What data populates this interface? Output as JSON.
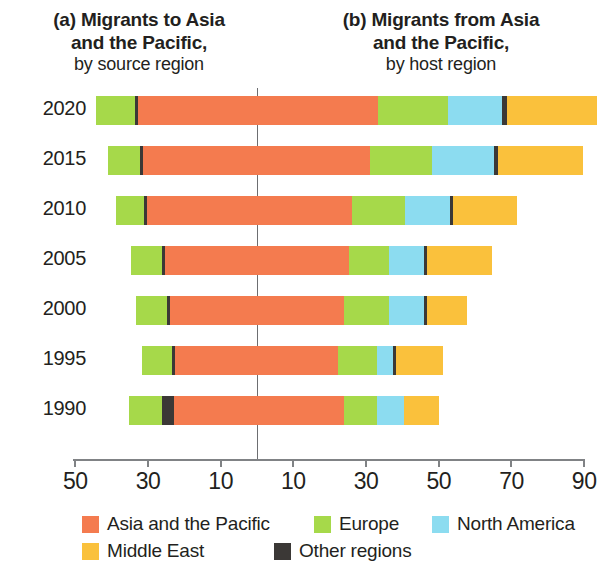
{
  "titles": {
    "panel_a": {
      "line1": "(a) Migrants to Asia",
      "line2": "and the Pacific,",
      "line3": "by source region"
    },
    "panel_b": {
      "line1": "(b) Migrants  from Asia",
      "line2": "and the Pacific,",
      "line3": "by host region"
    }
  },
  "colors": {
    "asia_pacific": "#F47B4F",
    "europe": "#A6D94A",
    "north_america": "#8CDCF0",
    "middle_east": "#FAC13C",
    "other": "#3B3836",
    "axis": "#808285",
    "zero_line": "#6D6E71",
    "text": "#231F20"
  },
  "legend": {
    "items": [
      {
        "label": "Asia and the Pacific",
        "color_key": "asia_pacific"
      },
      {
        "label": "Europe",
        "color_key": "europe"
      },
      {
        "label": "North America",
        "color_key": "north_america"
      },
      {
        "label": "Middle East",
        "color_key": "middle_east"
      },
      {
        "label": "Other regions",
        "color_key": "other"
      }
    ]
  },
  "chart_data": {
    "type": "bar",
    "subtype": "diverging-stacked-horizontal",
    "xlabel": "",
    "ylabel": "",
    "grid": false,
    "legend_position": "bottom",
    "axis": {
      "tick_values": [
        -50,
        -30,
        -10,
        10,
        30,
        50,
        70,
        90
      ],
      "tick_labels": [
        "50",
        "30",
        "10",
        "10",
        "30",
        "50",
        "70",
        "90"
      ],
      "xlim": [
        -55,
        91
      ],
      "zero_at": 0,
      "units": "millions"
    },
    "categories": [
      "2020",
      "2015",
      "2010",
      "2005",
      "2000",
      "1995",
      "1990"
    ],
    "series": [
      {
        "name": "Asia and the Pacific",
        "color_key": "asia_pacific"
      },
      {
        "name": "Europe",
        "color_key": "europe"
      },
      {
        "name": "North America",
        "color_key": "north_america"
      },
      {
        "name": "Middle East",
        "color_key": "middle_east"
      },
      {
        "name": "Other regions",
        "color_key": "other"
      }
    ],
    "rows": [
      {
        "year": "2020",
        "left": [
          {
            "series": "Europe",
            "color_key": "europe",
            "value": 10.7
          },
          {
            "series": "Other regions",
            "color_key": "other",
            "value": 0.8
          },
          {
            "series": "Asia and the Pacific",
            "color_key": "asia_pacific",
            "value": 32.8
          }
        ],
        "right": [
          {
            "series": "Asia and the Pacific",
            "color_key": "asia_pacific",
            "value": 33.2
          },
          {
            "series": "Europe",
            "color_key": "europe",
            "value": 19.3
          },
          {
            "series": "North America",
            "color_key": "north_america",
            "value": 14.9
          },
          {
            "series": "Other regions",
            "color_key": "other",
            "value": 1.4
          },
          {
            "series": "Middle East",
            "color_key": "middle_east",
            "value": 24.8
          }
        ],
        "left_total": 44.3,
        "right_total": 93.6
      },
      {
        "year": "2015",
        "left": [
          {
            "series": "Europe",
            "color_key": "europe",
            "value": 8.8
          },
          {
            "series": "Other regions",
            "color_key": "other",
            "value": 0.8
          },
          {
            "series": "Asia and the Pacific",
            "color_key": "asia_pacific",
            "value": 31.4
          }
        ],
        "right": [
          {
            "series": "Asia and the Pacific",
            "color_key": "asia_pacific",
            "value": 31.1
          },
          {
            "series": "Europe",
            "color_key": "europe",
            "value": 17.1
          },
          {
            "series": "North America",
            "color_key": "north_america",
            "value": 17.1
          },
          {
            "series": "Other regions",
            "color_key": "other",
            "value": 1.1
          },
          {
            "series": "Middle East",
            "color_key": "middle_east",
            "value": 23.4
          }
        ],
        "left_total": 41.0,
        "right_total": 89.8
      },
      {
        "year": "2010",
        "left": [
          {
            "series": "Europe",
            "color_key": "europe",
            "value": 7.7
          },
          {
            "series": "Other regions",
            "color_key": "other",
            "value": 0.8
          },
          {
            "series": "Asia and the Pacific",
            "color_key": "asia_pacific",
            "value": 30.2
          }
        ],
        "right": [
          {
            "series": "Asia and the Pacific",
            "color_key": "asia_pacific",
            "value": 26.2
          },
          {
            "series": "Europe",
            "color_key": "europe",
            "value": 14.6
          },
          {
            "series": "North America",
            "color_key": "north_america",
            "value": 12.4
          },
          {
            "series": "Other regions",
            "color_key": "other",
            "value": 0.8
          },
          {
            "series": "Middle East",
            "color_key": "middle_east",
            "value": 17.6
          }
        ],
        "left_total": 38.8,
        "right_total": 71.6
      },
      {
        "year": "2005",
        "left": [
          {
            "series": "Europe",
            "color_key": "europe",
            "value": 8.5
          },
          {
            "series": "Other regions",
            "color_key": "other",
            "value": 0.8
          },
          {
            "series": "Asia and the Pacific",
            "color_key": "asia_pacific",
            "value": 25.4
          }
        ],
        "right": [
          {
            "series": "Asia and the Pacific",
            "color_key": "asia_pacific",
            "value": 25.3
          },
          {
            "series": "Europe",
            "color_key": "europe",
            "value": 11.0
          },
          {
            "series": "North America",
            "color_key": "north_america",
            "value": 9.6
          },
          {
            "series": "Other regions",
            "color_key": "other",
            "value": 0.8
          },
          {
            "series": "Middle East",
            "color_key": "middle_east",
            "value": 17.9
          }
        ],
        "left_total": 34.7,
        "right_total": 64.6
      },
      {
        "year": "2000",
        "left": [
          {
            "series": "Europe",
            "color_key": "europe",
            "value": 8.5
          },
          {
            "series": "Other regions",
            "color_key": "other",
            "value": 0.8
          },
          {
            "series": "Asia and the Pacific",
            "color_key": "asia_pacific",
            "value": 24.5
          }
        ],
        "right": [
          {
            "series": "Asia and the Pacific",
            "color_key": "asia_pacific",
            "value": 24.0
          },
          {
            "series": "Europe",
            "color_key": "europe",
            "value": 12.4
          },
          {
            "series": "North America",
            "color_key": "north_america",
            "value": 9.6
          },
          {
            "series": "Other regions",
            "color_key": "other",
            "value": 0.8
          },
          {
            "series": "Middle East",
            "color_key": "middle_east",
            "value": 11.0
          }
        ],
        "left_total": 33.3,
        "right_total": 57.0
      },
      {
        "year": "1995",
        "left": [
          {
            "series": "Europe",
            "color_key": "europe",
            "value": 8.3
          },
          {
            "series": "Other regions",
            "color_key": "other",
            "value": 0.8
          },
          {
            "series": "Asia and the Pacific",
            "color_key": "asia_pacific",
            "value": 23.4
          }
        ],
        "right": [
          {
            "series": "Asia and the Pacific",
            "color_key": "asia_pacific",
            "value": 22.3
          },
          {
            "series": "Europe",
            "color_key": "europe",
            "value": 10.7
          },
          {
            "series": "North America",
            "color_key": "north_america",
            "value": 4.4
          },
          {
            "series": "Other regions",
            "color_key": "other",
            "value": 0.8
          },
          {
            "series": "Middle East",
            "color_key": "middle_east",
            "value": 12.9
          }
        ],
        "left_total": 31.7,
        "right_total": 50.1
      },
      {
        "year": "1990",
        "left": [
          {
            "series": "Europe",
            "color_key": "europe",
            "value": 9.1
          },
          {
            "series": "Other regions",
            "color_key": "other",
            "value": 3.3
          },
          {
            "series": "Asia and the Pacific",
            "color_key": "asia_pacific",
            "value": 22.9
          }
        ],
        "right": [
          {
            "series": "Asia and the Pacific",
            "color_key": "asia_pacific",
            "value": 24.0
          },
          {
            "series": "Europe",
            "color_key": "europe",
            "value": 9.1
          },
          {
            "series": "North America",
            "color_key": "north_america",
            "value": 7.4
          },
          {
            "series": "Middle East",
            "color_key": "middle_east",
            "value": 9.6
          }
        ],
        "left_total": 35.3,
        "right_total": 50.1
      }
    ]
  }
}
